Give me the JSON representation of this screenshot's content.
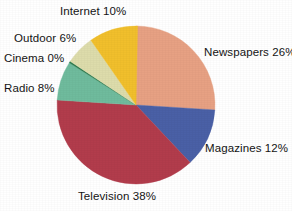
{
  "chart_data": {
    "type": "pie",
    "title": "",
    "xlabel": "",
    "ylabel": "",
    "legend_position": "none",
    "grid": false,
    "units": "percent",
    "start_angle_deg": 0,
    "direction": "clockwise",
    "categories": [
      "Newspapers",
      "Magazines",
      "Television",
      "Radio",
      "Cinema",
      "Outdoor",
      "Internet"
    ],
    "values": [
      26,
      12,
      38,
      8,
      0,
      6,
      10
    ],
    "colors": [
      "#e7a183",
      "#4a60a6",
      "#b23c4c",
      "#6fbb9d",
      "#2d7b4e",
      "#dddcab",
      "#f1bf2c"
    ],
    "slices": [
      {
        "label": "Newspapers",
        "value": 26,
        "display": "Newspapers 26%",
        "color": "#e7a183"
      },
      {
        "label": "Magazines",
        "value": 12,
        "display": "Magazines 12%",
        "color": "#4a60a6"
      },
      {
        "label": "Television",
        "value": 38,
        "display": "Television 38%",
        "color": "#b23c4c"
      },
      {
        "label": "Radio",
        "value": 8,
        "display": "Radio 8%",
        "color": "#6fbb9d"
      },
      {
        "label": "Cinema",
        "value": 0,
        "display": "Cinema 0%",
        "color": "#2d7b4e"
      },
      {
        "label": "Outdoor",
        "value": 6,
        "display": "Outdoor 6%",
        "color": "#dddcab"
      },
      {
        "label": "Internet",
        "value": 10,
        "display": "Internet 10%",
        "color": "#f1bf2c"
      }
    ],
    "annotations": [
      "Internet 10%",
      "Outdoor 6%",
      "Cinema 0%",
      "Radio 8%",
      "Newspapers 26%",
      "Magazines 12%",
      "Television 38%"
    ]
  },
  "figure": {
    "background": "#ffffff",
    "center_x": 136,
    "center_y": 105,
    "radius": 79
  },
  "labels": {
    "internet": "Internet 10%",
    "outdoor": "Outdoor 6%",
    "cinema": "Cinema 0%",
    "radio": "Radio 8%",
    "newspapers": "Newspapers 26%",
    "magazines": "Magazines 12%",
    "television": "Television 38%"
  }
}
